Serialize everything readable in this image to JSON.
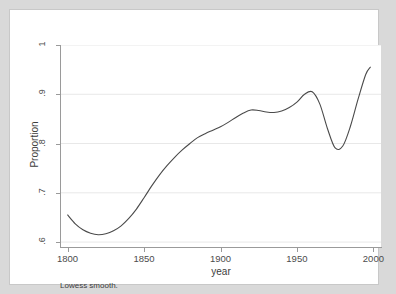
{
  "figure": {
    "background_color": "#d9d9d9",
    "plot_background_color": "#ffffff",
    "note": "Lowess smooth."
  },
  "chart_data": {
    "type": "line",
    "title": "",
    "subtitle": "",
    "note": "Lowess smooth.",
    "xlabel": "year",
    "ylabel": "Proportion",
    "xlim": [
      1795,
      2005
    ],
    "ylim": [
      0.59,
      1.0
    ],
    "xticks": [
      1800,
      1850,
      1900,
      1950,
      2000
    ],
    "xtick_labels": [
      "1800",
      "1850",
      "1900",
      "1950",
      "2000"
    ],
    "yticks": [
      0.6,
      0.7,
      0.8,
      0.9,
      1.0
    ],
    "ytick_labels": [
      ".6",
      ".7",
      ".8",
      ".9",
      "1"
    ],
    "grid": "horizontal",
    "legend": "none",
    "line_color": "#4a4a4a",
    "line_width": 1.1,
    "series": [
      {
        "name": "Lowess smooth",
        "x": [
          1800,
          1805,
          1810,
          1815,
          1820,
          1825,
          1830,
          1835,
          1840,
          1845,
          1850,
          1855,
          1860,
          1865,
          1870,
          1875,
          1880,
          1885,
          1890,
          1895,
          1900,
          1905,
          1910,
          1915,
          1920,
          1925,
          1930,
          1935,
          1940,
          1945,
          1950,
          1955,
          1960,
          1965,
          1970,
          1975,
          1980,
          1985,
          1990,
          1995,
          1998
        ],
        "y": [
          0.655,
          0.637,
          0.625,
          0.618,
          0.615,
          0.617,
          0.623,
          0.633,
          0.648,
          0.667,
          0.69,
          0.714,
          0.736,
          0.755,
          0.772,
          0.787,
          0.8,
          0.812,
          0.82,
          0.827,
          0.834,
          0.843,
          0.853,
          0.862,
          0.868,
          0.867,
          0.864,
          0.863,
          0.866,
          0.873,
          0.884,
          0.9,
          0.905,
          0.88,
          0.83,
          0.791,
          0.795,
          0.835,
          0.89,
          0.94,
          0.955
        ]
      }
    ]
  },
  "axes": {
    "y_title": "Proportion",
    "x_title": "year"
  }
}
